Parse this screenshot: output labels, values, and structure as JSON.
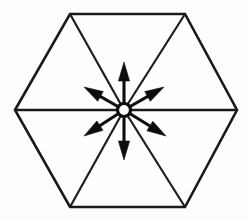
{
  "figure": {
    "title": "Hexagon with radial arrows from center",
    "background_color": "#fdfdfb",
    "line_color": "#1a1a1a",
    "arrow_color": "#0d0d0d",
    "width": 248,
    "height": 219
  },
  "hexagon": {
    "name": "regular-hexagon",
    "orientation": "flat-left-right-vertices",
    "vertex_count": 6,
    "vertices": [
      {
        "label": "left",
        "x": 15,
        "y": 110
      },
      {
        "label": "top-left",
        "x": 70,
        "y": 14
      },
      {
        "label": "top-right",
        "x": 185,
        "y": 14
      },
      {
        "label": "right",
        "x": 237,
        "y": 110
      },
      {
        "label": "bottom-right",
        "x": 185,
        "y": 207
      },
      {
        "label": "bottom-left",
        "x": 70,
        "y": 207
      }
    ],
    "center": {
      "x": 124,
      "y": 110
    },
    "internal_triangles": 6,
    "internal_edges": [
      {
        "label": "spoke-top-left",
        "from": "top-left",
        "to": "center"
      },
      {
        "label": "spoke-top-right",
        "from": "top-right",
        "to": "center"
      },
      {
        "label": "spoke-bottom-right",
        "from": "bottom-right",
        "to": "center"
      },
      {
        "label": "spoke-bottom-left",
        "from": "bottom-left",
        "to": "center"
      },
      {
        "label": "equator",
        "from": "left",
        "to": "right"
      }
    ]
  },
  "hub": {
    "name": "center-ring",
    "x": 124,
    "y": 110,
    "radius": 6.5,
    "style": "open-circle"
  },
  "arrows": [
    {
      "label": "arrow-up",
      "angle_deg": 90,
      "tip_x": 124,
      "tip_y": 62
    },
    {
      "label": "arrow-upper-right",
      "angle_deg": 30,
      "tip_x": 164,
      "tip_y": 87
    },
    {
      "label": "arrow-lower-right",
      "angle_deg": -30,
      "tip_x": 166,
      "tip_y": 136
    },
    {
      "label": "arrow-down",
      "angle_deg": -90,
      "tip_x": 124,
      "tip_y": 160
    },
    {
      "label": "arrow-lower-left",
      "angle_deg": -150,
      "tip_x": 84,
      "tip_y": 136
    },
    {
      "label": "arrow-upper-left",
      "angle_deg": 150,
      "tip_x": 84,
      "tip_y": 87
    }
  ]
}
